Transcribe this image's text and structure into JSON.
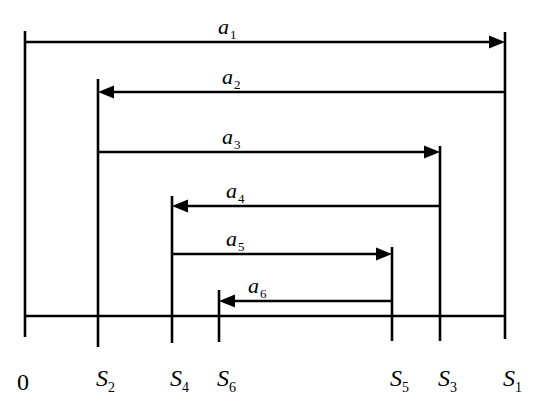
{
  "diagram": {
    "title": "",
    "baseline": {
      "y": 316,
      "x_start": 25,
      "x_end": 505
    },
    "origin": {
      "label": "0",
      "x": 25,
      "top": 31,
      "bottom": 337
    },
    "positions": [
      {
        "id": "S2",
        "base": "S",
        "sub": "2",
        "x": 98,
        "top": 79,
        "bottom": 347
      },
      {
        "id": "S4",
        "base": "S",
        "sub": "4",
        "x": 172,
        "top": 196,
        "bottom": 343
      },
      {
        "id": "S6",
        "base": "S",
        "sub": "6",
        "x": 219,
        "top": 290,
        "bottom": 342
      },
      {
        "id": "S5",
        "base": "S",
        "sub": "5",
        "x": 392,
        "top": 247,
        "bottom": 341
      },
      {
        "id": "S3",
        "base": "S",
        "sub": "3",
        "x": 440,
        "top": 146,
        "bottom": 341
      },
      {
        "id": "S1",
        "base": "S",
        "sub": "1",
        "x": 505,
        "top": 32,
        "bottom": 339
      }
    ],
    "arrows": [
      {
        "id": "a1",
        "base": "a",
        "sub": "1",
        "y": 42,
        "from_x": 25,
        "to_x": 505,
        "direction": "right"
      },
      {
        "id": "a2",
        "base": "a",
        "sub": "2",
        "y": 92,
        "from_x": 505,
        "to_x": 98,
        "direction": "left"
      },
      {
        "id": "a3",
        "base": "a",
        "sub": "3",
        "y": 152,
        "from_x": 98,
        "to_x": 440,
        "direction": "right"
      },
      {
        "id": "a4",
        "base": "a",
        "sub": "4",
        "y": 206,
        "from_x": 440,
        "to_x": 172,
        "direction": "left"
      },
      {
        "id": "a5",
        "base": "a",
        "sub": "5",
        "y": 254,
        "from_x": 172,
        "to_x": 392,
        "direction": "right"
      },
      {
        "id": "a6",
        "base": "a",
        "sub": "6",
        "y": 301,
        "from_x": 392,
        "to_x": 219,
        "direction": "left"
      }
    ],
    "arrow_label_x": [
      218,
      222,
      222,
      226,
      226,
      248
    ],
    "position_label_y": 390,
    "colors": {
      "stroke": "#000000",
      "background": "#ffffff"
    }
  }
}
